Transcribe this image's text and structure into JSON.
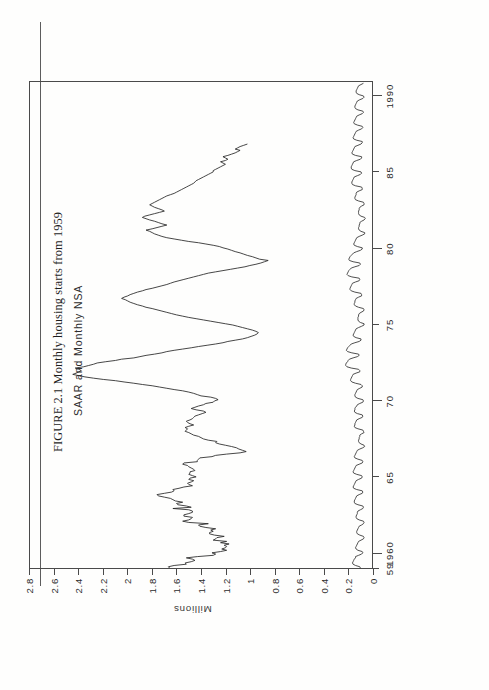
{
  "figure": {
    "caption_number": "FIGURE 2.1",
    "caption_text": "Monthly housing starts from 1959",
    "caption_full": "FIGURE 2.1  Monthly housing starts from 1959"
  },
  "chart_data": {
    "type": "line",
    "title": "Monthly housing starts from 1959",
    "annotation": "SAAR and Monthly NSA",
    "xlabel": "",
    "ylabel": "Millions",
    "xlim": [
      1959.0,
      1991.0
    ],
    "ylim": [
      0,
      2.8
    ],
    "grid": false,
    "legend_position": "inside-top-left",
    "x_ticks": [
      1959,
      1960,
      1965,
      1970,
      1975,
      1980,
      1985,
      1990
    ],
    "x_tick_labels": [
      "59",
      "1960",
      "65",
      "70",
      "75",
      "80",
      "85",
      "1990"
    ],
    "y_ticks": [
      0,
      0.2,
      0.4,
      0.6,
      0.8,
      1,
      1.2,
      1.4,
      1.6,
      1.8,
      2,
      2.2,
      2.4,
      2.6,
      2.8
    ],
    "y_tick_labels": [
      "0",
      "0.2",
      "0.4",
      "0.6",
      "0.8",
      "1",
      "1.2",
      "1.4",
      "1.6",
      "1.8",
      "2",
      "2.2",
      "2.4",
      "2.6",
      "2.8"
    ],
    "series": [
      {
        "name": "SAAR",
        "units": "Millions of units, seasonally adjusted annual rate",
        "color": "#262626",
        "x_start": 1959.0,
        "x_step": 0.08333,
        "values": [
          1.657,
          1.667,
          1.62,
          1.52,
          1.53,
          1.48,
          1.45,
          1.47,
          1.52,
          1.43,
          1.3,
          1.28,
          1.31,
          1.24,
          1.19,
          1.23,
          1.2,
          1.19,
          1.21,
          1.17,
          1.24,
          1.19,
          1.3,
          1.28,
          1.27,
          1.21,
          1.29,
          1.33,
          1.33,
          1.3,
          1.32,
          1.28,
          1.36,
          1.41,
          1.42,
          1.34,
          1.5,
          1.55,
          1.5,
          1.48,
          1.47,
          1.54,
          1.54,
          1.5,
          1.47,
          1.47,
          1.5,
          1.63,
          1.48,
          1.52,
          1.59,
          1.6,
          1.55,
          1.61,
          1.63,
          1.65,
          1.7,
          1.75,
          1.76,
          1.7,
          1.64,
          1.62,
          1.63,
          1.58,
          1.54,
          1.47,
          1.5,
          1.51,
          1.48,
          1.46,
          1.5,
          1.49,
          1.44,
          1.47,
          1.5,
          1.49,
          1.49,
          1.45,
          1.46,
          1.48,
          1.5,
          1.51,
          1.55,
          1.54,
          1.43,
          1.43,
          1.42,
          1.41,
          1.31,
          1.28,
          1.19,
          1.08,
          1.03,
          1.06,
          1.09,
          1.11,
          1.15,
          1.2,
          1.25,
          1.28,
          1.27,
          1.34,
          1.38,
          1.4,
          1.42,
          1.46,
          1.48,
          1.5,
          1.53,
          1.52,
          1.51,
          1.53,
          1.5,
          1.46,
          1.49,
          1.51,
          1.52,
          1.49,
          1.47,
          1.46,
          1.45,
          1.42,
          1.39,
          1.36,
          1.38,
          1.44,
          1.48,
          1.45,
          1.42,
          1.38,
          1.36,
          1.3,
          1.29,
          1.26,
          1.28,
          1.32,
          1.4,
          1.43,
          1.46,
          1.5,
          1.55,
          1.62,
          1.68,
          1.74,
          1.8,
          1.88,
          1.95,
          2.03,
          2.1,
          2.2,
          2.28,
          2.35,
          2.4,
          2.45,
          2.42,
          2.4,
          2.38,
          2.4,
          2.43,
          2.36,
          2.32,
          2.28,
          2.25,
          2.18,
          2.1,
          2.05,
          1.95,
          1.9,
          1.85,
          1.78,
          1.72,
          1.68,
          1.62,
          1.55,
          1.48,
          1.42,
          1.35,
          1.28,
          1.22,
          1.18,
          1.12,
          1.06,
          1.02,
          0.99,
          0.96,
          0.94,
          0.93,
          0.95,
          0.98,
          1.02,
          1.06,
          1.1,
          1.14,
          1.2,
          1.26,
          1.32,
          1.38,
          1.44,
          1.5,
          1.55,
          1.6,
          1.64,
          1.68,
          1.72,
          1.76,
          1.8,
          1.85,
          1.88,
          1.92,
          1.95,
          1.98,
          2.0,
          2.02,
          2.05,
          2.03,
          2.0,
          1.98,
          1.95,
          1.92,
          1.88,
          1.85,
          1.8,
          1.76,
          1.72,
          1.68,
          1.65,
          1.62,
          1.58,
          1.54,
          1.5,
          1.46,
          1.42,
          1.38,
          1.34,
          1.28,
          1.22,
          1.16,
          1.1,
          1.04,
          1.0,
          0.95,
          0.91,
          0.88,
          0.85,
          0.92,
          0.95,
          0.98,
          1.02,
          1.05,
          1.08,
          1.12,
          1.15,
          1.18,
          1.22,
          1.25,
          1.3,
          1.36,
          1.42,
          1.5,
          1.56,
          1.62,
          1.68,
          1.72,
          1.75,
          1.78,
          1.8,
          1.82,
          1.85,
          1.8,
          1.76,
          1.72,
          1.68,
          1.72,
          1.75,
          1.78,
          1.82,
          1.85,
          1.88,
          1.86,
          1.82,
          1.78,
          1.74,
          1.7,
          1.72,
          1.75,
          1.78,
          1.8,
          1.82,
          1.8,
          1.78,
          1.76,
          1.74,
          1.72,
          1.7,
          1.68,
          1.65,
          1.62,
          1.6,
          1.58,
          1.56,
          1.54,
          1.52,
          1.5,
          1.48,
          1.46,
          1.45,
          1.44,
          1.42,
          1.4,
          1.38,
          1.36,
          1.34,
          1.32,
          1.3,
          1.3,
          1.28,
          1.26,
          1.24,
          1.22,
          1.2,
          1.22,
          1.24,
          1.2,
          1.18,
          1.2,
          1.22,
          1.18,
          1.15,
          1.12,
          1.1,
          1.08,
          1.12,
          1.1,
          1.08,
          1.05,
          1.02
        ]
      },
      {
        "name": "Monthly NSA",
        "units": "Millions of units, not seasonally adjusted",
        "color": "#303030",
        "x_start": 1959.0,
        "x_step": 0.08333,
        "values": [
          0.095,
          0.1,
          0.135,
          0.155,
          0.16,
          0.155,
          0.15,
          0.145,
          0.135,
          0.135,
          0.11,
          0.085,
          0.075,
          0.08,
          0.115,
          0.13,
          0.135,
          0.13,
          0.125,
          0.12,
          0.115,
          0.11,
          0.09,
          0.07,
          0.065,
          0.07,
          0.1,
          0.12,
          0.125,
          0.125,
          0.12,
          0.115,
          0.11,
          0.105,
          0.085,
          0.07,
          0.065,
          0.07,
          0.105,
          0.125,
          0.13,
          0.13,
          0.125,
          0.12,
          0.12,
          0.115,
          0.095,
          0.075,
          0.07,
          0.075,
          0.115,
          0.14,
          0.145,
          0.145,
          0.14,
          0.135,
          0.13,
          0.125,
          0.105,
          0.08,
          0.075,
          0.08,
          0.125,
          0.15,
          0.155,
          0.15,
          0.145,
          0.14,
          0.135,
          0.13,
          0.11,
          0.085,
          0.08,
          0.085,
          0.125,
          0.15,
          0.155,
          0.15,
          0.145,
          0.14,
          0.135,
          0.13,
          0.105,
          0.08,
          0.075,
          0.08,
          0.115,
          0.14,
          0.145,
          0.14,
          0.135,
          0.13,
          0.125,
          0.12,
          0.1,
          0.075,
          0.06,
          0.065,
          0.09,
          0.105,
          0.11,
          0.11,
          0.105,
          0.105,
          0.1,
          0.1,
          0.085,
          0.065,
          0.07,
          0.075,
          0.115,
          0.14,
          0.145,
          0.14,
          0.14,
          0.135,
          0.13,
          0.125,
          0.105,
          0.08,
          0.075,
          0.08,
          0.12,
          0.14,
          0.145,
          0.14,
          0.14,
          0.135,
          0.125,
          0.12,
          0.1,
          0.075,
          0.07,
          0.075,
          0.115,
          0.135,
          0.14,
          0.14,
          0.135,
          0.13,
          0.125,
          0.12,
          0.1,
          0.08,
          0.08,
          0.09,
          0.135,
          0.165,
          0.175,
          0.175,
          0.17,
          0.165,
          0.16,
          0.155,
          0.13,
          0.1,
          0.1,
          0.11,
          0.17,
          0.205,
          0.215,
          0.215,
          0.21,
          0.2,
          0.195,
          0.185,
          0.155,
          0.12,
          0.105,
          0.11,
          0.165,
          0.2,
          0.21,
          0.205,
          0.2,
          0.19,
          0.18,
          0.17,
          0.14,
          0.105,
          0.09,
          0.09,
          0.13,
          0.15,
          0.155,
          0.15,
          0.145,
          0.14,
          0.135,
          0.13,
          0.11,
          0.085,
          0.065,
          0.065,
          0.095,
          0.11,
          0.115,
          0.115,
          0.115,
          0.11,
          0.11,
          0.105,
          0.09,
          0.07,
          0.065,
          0.07,
          0.11,
          0.135,
          0.145,
          0.145,
          0.14,
          0.14,
          0.135,
          0.13,
          0.11,
          0.085,
          0.085,
          0.09,
          0.14,
          0.17,
          0.18,
          0.18,
          0.175,
          0.17,
          0.165,
          0.16,
          0.135,
          0.105,
          0.1,
          0.105,
          0.165,
          0.195,
          0.205,
          0.2,
          0.195,
          0.19,
          0.18,
          0.17,
          0.14,
          0.105,
          0.095,
          0.1,
          0.155,
          0.185,
          0.19,
          0.185,
          0.18,
          0.17,
          0.16,
          0.15,
          0.125,
          0.095,
          0.08,
          0.08,
          0.12,
          0.145,
          0.15,
          0.145,
          0.14,
          0.135,
          0.13,
          0.125,
          0.105,
          0.08,
          0.06,
          0.06,
          0.09,
          0.105,
          0.11,
          0.11,
          0.105,
          0.105,
          0.1,
          0.1,
          0.085,
          0.065,
          0.055,
          0.06,
          0.09,
          0.105,
          0.11,
          0.11,
          0.11,
          0.105,
          0.105,
          0.1,
          0.085,
          0.065,
          0.065,
          0.07,
          0.11,
          0.135,
          0.14,
          0.14,
          0.135,
          0.13,
          0.13,
          0.125,
          0.105,
          0.08,
          0.08,
          0.085,
          0.135,
          0.16,
          0.165,
          0.165,
          0.16,
          0.155,
          0.15,
          0.145,
          0.12,
          0.095,
          0.085,
          0.09,
          0.14,
          0.165,
          0.17,
          0.17,
          0.165,
          0.16,
          0.155,
          0.15,
          0.125,
          0.095,
          0.085,
          0.085,
          0.135,
          0.16,
          0.165,
          0.16,
          0.155,
          0.15,
          0.145,
          0.14,
          0.115,
          0.09,
          0.08,
          0.08,
          0.125,
          0.15,
          0.155,
          0.15,
          0.145,
          0.14,
          0.135,
          0.13,
          0.11,
          0.085,
          0.075,
          0.08,
          0.12,
          0.145,
          0.15,
          0.145,
          0.14,
          0.135,
          0.13,
          0.125,
          0.105,
          0.08,
          0.07,
          0.075,
          0.115,
          0.135,
          0.14,
          0.14,
          0.135,
          0.13,
          0.125,
          0.12,
          0.1,
          0.075,
          0.065,
          0.07,
          0.105,
          0.125,
          0.13,
          0.13,
          0.125,
          0.12,
          0.115,
          0.11,
          0.09,
          0.07
        ]
      }
    ]
  }
}
